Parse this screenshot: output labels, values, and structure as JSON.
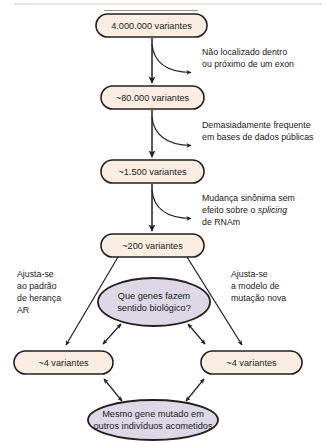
{
  "diagram": {
    "colors": {
      "box_fill": "#faeee2",
      "ellipse_fill": "#dcd8e6",
      "stroke": "#231f20",
      "background": "#ffffff"
    },
    "nodes": {
      "total_variants": "4.000.000 variantes",
      "exonic_variants": "~80.000 variantes",
      "rare_variants": "~1.500 variantes",
      "functional_variants": "~200 variantes",
      "biological_question": {
        "line1": "Que genes fazem",
        "line2": "sentido biológico?"
      },
      "recessive_variants": "~4 variantes",
      "denovo_variants": "~4 variantes",
      "same_gene_conclusion": {
        "line1": "Mesmo gene mutado em",
        "line2": "outros indivíduos acometidos"
      }
    },
    "annotations": {
      "filter_location": {
        "line1": "Não localizado dentro",
        "line2": "ou próximo de um exon"
      },
      "filter_frequency": {
        "line1": "Demasiadamente frequente",
        "line2": "em bases de dados públicas"
      },
      "filter_synonymous": {
        "line1": "Mudança sinônima sem",
        "line2_pre": "efeito sobre o ",
        "line2_italic": "splicing",
        "line3": "de RNAm"
      }
    },
    "side_labels": {
      "recessive_model": {
        "line1": "Ajusta-se",
        "line2": "ao padrão",
        "line3": "de herança",
        "line4": "AR"
      },
      "denovo_model": {
        "line1": "Ajusta-se",
        "line2": "a modelo de",
        "line3": "mutação nova"
      }
    }
  }
}
